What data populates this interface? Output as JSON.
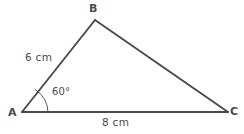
{
  "figure": {
    "kind": "triangle-diagram",
    "background_color": "#ffffff",
    "stroke_color": "#4a4a4a",
    "text_color": "#4a4a4a",
    "vertices": {
      "a": {
        "label": "A",
        "x": 22,
        "y": 112
      },
      "b": {
        "label": "B",
        "x": 95,
        "y": 20
      },
      "c": {
        "label": "C",
        "x": 228,
        "y": 112
      }
    },
    "sides": {
      "ab": {
        "length_label": "6 cm"
      },
      "ac": {
        "length_label": "8 cm"
      },
      "bc": {
        "length_label": ""
      }
    },
    "angles": {
      "a": {
        "label": "60°",
        "arc_radius": 26
      }
    }
  }
}
